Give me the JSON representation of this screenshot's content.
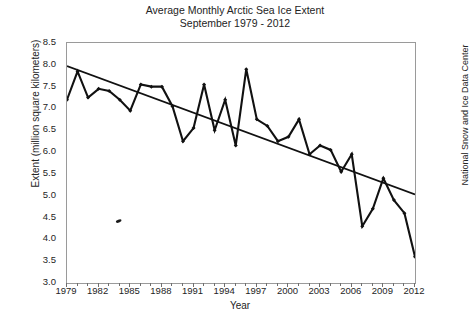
{
  "chart_data": {
    "type": "line",
    "title": "Average Monthly Arctic Sea Ice Extent",
    "subtitle": "September 1979 - 2012",
    "xlabel": "Year",
    "ylabel": "Extent (million square kilometers)",
    "credit": "National Snow and Ice Data Center",
    "xlim": [
      1979,
      2012
    ],
    "ylim": [
      3.0,
      8.5
    ],
    "grid": false,
    "legend": "none",
    "y_ticks": [
      "3.0",
      "3.5",
      "4.0",
      "4.5",
      "5.0",
      "5.5",
      "6.0",
      "6.5",
      "7.0",
      "7.5",
      "8.0",
      "8.5"
    ],
    "x_ticks": [
      "1979",
      "1982",
      "1985",
      "1988",
      "1991",
      "1994",
      "1997",
      "2000",
      "2003",
      "2006",
      "2009",
      "2012"
    ],
    "x_tick_step_years": 3,
    "x_minor_tick_step_years": 1,
    "x": [
      1979,
      1980,
      1981,
      1982,
      1983,
      1984,
      1985,
      1986,
      1987,
      1988,
      1989,
      1990,
      1991,
      1992,
      1993,
      1994,
      1995,
      1996,
      1997,
      1998,
      1999,
      2000,
      2001,
      2002,
      2003,
      2004,
      2005,
      2006,
      2007,
      2008,
      2009,
      2010,
      2011,
      2012
    ],
    "series": [
      {
        "name": "September sea ice extent",
        "marker": "filled-diamond",
        "color": "#111111",
        "values": [
          7.2,
          7.85,
          7.25,
          7.45,
          7.4,
          7.2,
          6.95,
          7.55,
          7.5,
          7.5,
          7.05,
          6.25,
          6.55,
          7.55,
          6.5,
          7.2,
          6.15,
          7.9,
          6.75,
          6.6,
          6.25,
          6.35,
          6.75,
          5.95,
          6.15,
          6.05,
          5.55,
          5.95,
          4.3,
          4.7,
          5.4,
          4.9,
          4.6,
          3.6
        ]
      }
    ],
    "trendline": {
      "name": "linear trend",
      "color": "#111111",
      "start": {
        "x": 1979,
        "y": 7.97
      },
      "end": {
        "x": 2012,
        "y": 5.03
      }
    },
    "annotations": [
      {
        "name": "stray-mark",
        "x": 1983.9,
        "y": 4.42
      }
    ]
  },
  "figure": {
    "background": "#ffffff",
    "axis_color": "#9a9a9a",
    "text_color": "#242424"
  }
}
